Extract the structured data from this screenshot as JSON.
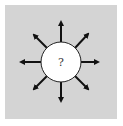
{
  "diagram": {
    "center_label": "?",
    "center_shape": "circle",
    "arrow_directions": [
      "north",
      "north-east",
      "east",
      "south-east",
      "south",
      "south-west",
      "west",
      "north-west"
    ],
    "colors": {
      "background": "#d4d4d4",
      "circle_fill": "#ffffff",
      "stroke": "#111111"
    }
  }
}
